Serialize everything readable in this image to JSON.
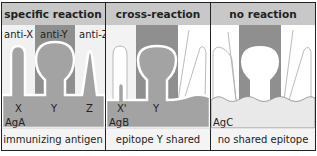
{
  "colors": {
    "header_bg": "#c8c8c8",
    "antigen_bg": "#a3a3a3",
    "antibody_dark": "#8a8a8a",
    "antibody_light": "#e9e9e9",
    "panel_bg": "#ffffff",
    "border": "#222222",
    "caption_bg": "#f4f4f4"
  },
  "panels": [
    {
      "header": "specific reaction",
      "antibodies": [
        "anti-X",
        "anti-Y",
        "anti-Z"
      ],
      "epitopes": [
        "X",
        "Y",
        "Z"
      ],
      "antigen": "AgA",
      "caption": "immunizing antigen"
    },
    {
      "header": "cross-reaction",
      "epitopes": [
        "X'",
        "Y"
      ],
      "antigen": "AgB",
      "caption": "epitope Y shared"
    },
    {
      "header": "no reaction",
      "antigen": "AgC",
      "caption": "no shared epitope"
    }
  ]
}
